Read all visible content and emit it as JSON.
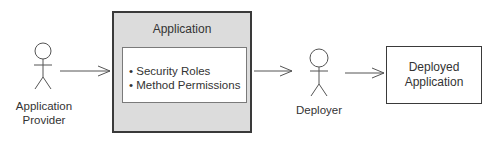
{
  "diagram": {
    "actors": [
      {
        "id": "application-provider",
        "label_lines": [
          "Application",
          "Provider"
        ]
      },
      {
        "id": "deployer",
        "label_lines": [
          "Deployer"
        ]
      }
    ],
    "application_box": {
      "title": "Application",
      "items": [
        "• Security Roles",
        "• Method Permissions"
      ]
    },
    "deployed_box": {
      "label_lines": [
        "Deployed",
        "Application"
      ]
    },
    "colors": {
      "application_fill": "#dcdcdc",
      "stroke": "#3a3a3a",
      "background": "#ffffff"
    }
  }
}
